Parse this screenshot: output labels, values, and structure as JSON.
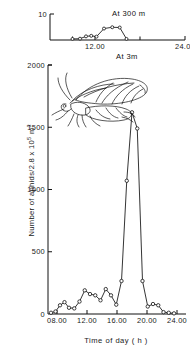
{
  "figure": {
    "title": "",
    "xlabel": "Time of day ( h )",
    "ylabel_prefix": "Number of aphids/2.8 x 10",
    "ylabel_exp": "5",
    "ylabel_suffix": " m",
    "ylabel_suffix_exp": "3"
  },
  "panels": {
    "top": {
      "annotation": "At 300 m",
      "y_ticks": [
        "10"
      ],
      "x_ticks": [
        "12.00",
        "24.00"
      ]
    },
    "bottom": {
      "annotation": "At 3m",
      "y_ticks": [
        "2000",
        "1500",
        "1000",
        "500",
        "0"
      ],
      "x_ticks": [
        "08.00",
        "12.00",
        "16.00",
        "20.00",
        "24.00"
      ]
    }
  },
  "icons": {
    "aphid": "winged-aphid-illustration"
  },
  "chart_data": [
    {
      "type": "line",
      "title": "At 300 m",
      "xlabel": "",
      "ylabel": "",
      "xlim": [
        6,
        24
      ],
      "ylim": [
        0,
        10
      ],
      "grid": false,
      "legend": null,
      "marker": "open-circle",
      "x": [
        9.0,
        10.0,
        10.8,
        11.5,
        12.2,
        13.2,
        14.3,
        15.3,
        16.2
      ],
      "y": [
        0.4,
        0.5,
        1.4,
        1.6,
        1.3,
        4.4,
        4.9,
        4.8,
        0.4
      ],
      "tick_labels_x": [
        "12.00",
        "24.00"
      ],
      "tick_values_x": [
        12,
        24
      ],
      "tick_labels_y": [
        "10"
      ],
      "tick_values_y": [
        10
      ]
    },
    {
      "type": "line",
      "title": "At 3m",
      "xlabel": "Time of day ( h )",
      "ylabel": "Number of aphids/2.8 x 10^5 m^3",
      "xlim": [
        6.8,
        25.2
      ],
      "ylim": [
        0,
        2000
      ],
      "grid": false,
      "legend": null,
      "marker": "open-circle",
      "x": [
        7.2,
        7.8,
        8.4,
        9.0,
        9.6,
        10.3,
        11.0,
        11.7,
        12.4,
        13.1,
        13.8,
        14.5,
        15.2,
        15.9,
        16.6,
        17.3,
        18.0,
        18.7,
        19.4,
        20.1,
        20.8,
        21.5,
        22.2,
        22.9,
        23.6
      ],
      "y": [
        10,
        20,
        70,
        95,
        50,
        45,
        100,
        190,
        160,
        150,
        110,
        200,
        150,
        75,
        265,
        1070,
        1620,
        1490,
        265,
        60,
        80,
        70,
        15,
        10,
        5
      ],
      "tick_labels_x": [
        "08.00",
        "12.00",
        "16.00",
        "20.00",
        "24.00"
      ],
      "tick_values_x": [
        8,
        12,
        16,
        20,
        24
      ],
      "tick_labels_y": [
        "0",
        "500",
        "1000",
        "1500",
        "2000"
      ],
      "tick_values_y": [
        0,
        500,
        1000,
        1500,
        2000
      ]
    }
  ]
}
